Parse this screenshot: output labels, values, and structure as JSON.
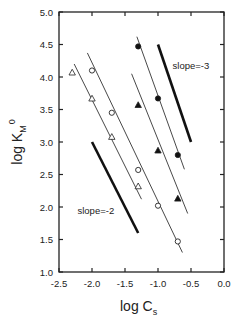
{
  "chart_data": {
    "type": "scatter",
    "title": "",
    "xlabel": "log C_s",
    "ylabel": "log K_M^0",
    "xlim": [
      -2.5,
      0.0
    ],
    "ylim": [
      1.0,
      5.0
    ],
    "x_ticks": [
      "-2.5",
      "-2.0",
      "-1.5",
      "-1.0",
      "-0.5",
      "0.0"
    ],
    "y_ticks": [
      "1.0",
      "1.5",
      "2.0",
      "2.5",
      "3.0",
      "3.5",
      "4.0",
      "4.5",
      "5.0"
    ],
    "grid": false,
    "legend": null,
    "series": [
      {
        "name": "open triangles",
        "marker": "open-triangle",
        "x": [
          -2.3,
          -2.0,
          -1.7,
          -1.3
        ],
        "y": [
          4.07,
          3.67,
          3.08,
          2.32
        ],
        "fit": [
          [
            -2.27,
            4.2
          ],
          [
            -1.25,
            2.12
          ]
        ]
      },
      {
        "name": "open circles",
        "marker": "open-circle",
        "x": [
          -2.0,
          -1.7,
          -1.3,
          -1.0,
          -0.7
        ],
        "y": [
          4.1,
          3.45,
          2.57,
          2.02,
          1.47
        ],
        "fit": [
          [
            -2.07,
            4.37
          ],
          [
            -0.63,
            1.3
          ]
        ]
      },
      {
        "name": "filled triangles",
        "marker": "filled-triangle",
        "x": [
          -1.3,
          -1.0,
          -0.7
        ],
        "y": [
          3.57,
          2.87,
          2.13
        ],
        "fit": [
          [
            -1.4,
            4.05
          ],
          [
            -0.55,
            1.9
          ]
        ]
      },
      {
        "name": "filled circles",
        "marker": "filled-circle",
        "x": [
          -1.3,
          -1.0,
          -0.7
        ],
        "y": [
          4.47,
          3.67,
          2.8
        ],
        "fit": [
          [
            -1.32,
            4.62
          ],
          [
            -0.6,
            2.58
          ]
        ]
      }
    ],
    "reference_lines": [
      {
        "label": "slope=-2",
        "x": [
          -2.0,
          -1.3
        ],
        "y": [
          3.0,
          1.6
        ],
        "label_pos": [
          -2.22,
          1.9
        ]
      },
      {
        "label": "slope=-3",
        "x": [
          -1.0,
          -0.5
        ],
        "y": [
          4.5,
          3.0
        ],
        "label_pos": [
          -0.78,
          4.12
        ]
      }
    ]
  },
  "labels": {
    "xlabel_main": "log C",
    "xlabel_sub": "s",
    "ylabel_main": "log K",
    "ylabel_sub": "M",
    "ylabel_sup": "0"
  }
}
